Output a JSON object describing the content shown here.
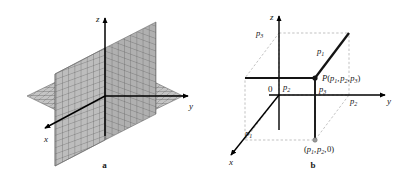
{
  "figure": {
    "panels": [
      {
        "id": "a",
        "caption": "a",
        "description": "Three mutually perpendicular coordinate planes with grid shading",
        "axes": [
          {
            "name": "z-axis",
            "label": "z",
            "direction": "up"
          },
          {
            "name": "y-axis",
            "label": "y",
            "direction": "right"
          },
          {
            "name": "x-axis",
            "label": "x",
            "direction": "down-left"
          }
        ]
      },
      {
        "id": "b",
        "caption": "b",
        "description": "Point P located by its three coordinates in a dashed reference box",
        "axes": [
          {
            "name": "z-axis",
            "label": "z",
            "direction": "up"
          },
          {
            "name": "y-axis",
            "label": "y",
            "direction": "right"
          },
          {
            "name": "x-axis",
            "label": "x",
            "direction": "down-left"
          }
        ],
        "origin_label": "0",
        "labels": {
          "z_intercept": "p",
          "z_intercept_sub": "3",
          "x_intercept": "p",
          "x_intercept_sub": "1",
          "y_intercept": "p",
          "y_intercept_sub": "2",
          "segment_x": "p",
          "segment_x_sub": "1",
          "segment_y": "p",
          "segment_y_sub": "2",
          "segment_z": "p",
          "segment_z_sub": "3",
          "point_name": "P",
          "point_coords": "(p1, p2, p3)",
          "foot_coords": "(p1, p2, 0)"
        }
      }
    ]
  },
  "colors": {
    "ink": "#141414",
    "axis": "#000000",
    "dashed": "#9a9a9a",
    "grid_fill_light": "#c9c9c9",
    "grid_fill_mid": "#b5b5b5",
    "grid_fill_dark": "#a3a3a3",
    "grid_line": "#4a4a4a"
  }
}
